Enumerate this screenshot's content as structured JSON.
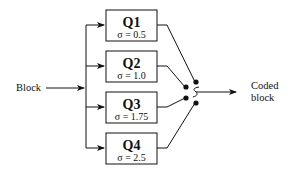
{
  "diagram": {
    "input_label": "Block",
    "output_label_line1": "Coded",
    "output_label_line2": "block",
    "quantizers": [
      {
        "name": "Q1",
        "sigma": "σ = 0.5"
      },
      {
        "name": "Q2",
        "sigma": "σ = 1.0"
      },
      {
        "name": "Q3",
        "sigma": "σ = 1.75"
      },
      {
        "name": "Q4",
        "sigma": "σ = 2.5"
      }
    ],
    "colors": {
      "stroke": "#111111",
      "background": "#ffffff"
    }
  }
}
